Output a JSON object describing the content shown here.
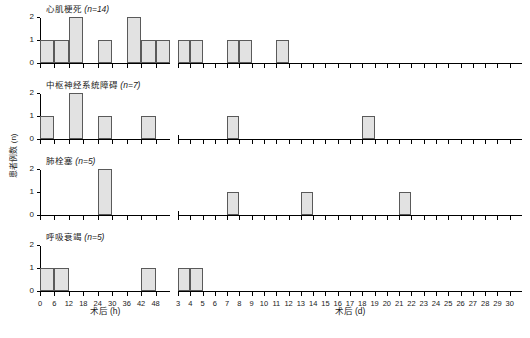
{
  "chart_data": {
    "type": "bar",
    "title": "",
    "ylabel": "患者例数 (n)",
    "ylim": [
      0,
      2
    ],
    "yticks": [
      0,
      1,
      2
    ],
    "grid": false,
    "legend": "none",
    "axes": [
      {
        "id": "hours",
        "xlabel": "术后 (h)",
        "xticks": [
          0,
          6,
          12,
          18,
          24,
          30,
          36,
          42,
          48
        ],
        "xlim": [
          0,
          54
        ],
        "bin_width": 6
      },
      {
        "id": "days",
        "xlabel": "术后 (d)",
        "xticks": [
          3,
          4,
          5,
          6,
          7,
          8,
          9,
          10,
          11,
          12,
          13,
          14,
          15,
          16,
          17,
          18,
          19,
          20,
          21,
          22,
          23,
          24,
          25,
          26,
          27,
          28,
          29,
          30
        ],
        "xlim": [
          3,
          31
        ],
        "bin_width": 1
      }
    ],
    "panels": [
      {
        "name": "心肌梗死",
        "n_label": "n=14",
        "hours": {
          "x": [
            0,
            6,
            12,
            24,
            36,
            42,
            48
          ],
          "values": [
            1,
            1,
            2,
            1,
            2,
            1,
            1
          ]
        },
        "days": {
          "x": [
            3,
            4,
            7,
            8,
            11
          ],
          "values": [
            1,
            1,
            1,
            1,
            1
          ]
        }
      },
      {
        "name": "中枢神经系统障碍",
        "n_label": "n=7",
        "hours": {
          "x": [
            0,
            12,
            24,
            42
          ],
          "values": [
            1,
            2,
            1,
            1
          ]
        },
        "days": {
          "x": [
            7,
            18
          ],
          "values": [
            1,
            1
          ]
        }
      },
      {
        "name": "肺栓塞",
        "n_label": "n=5",
        "hours": {
          "x": [
            24
          ],
          "values": [
            2
          ]
        },
        "days": {
          "x": [
            7,
            13,
            21
          ],
          "values": [
            1,
            1,
            1
          ]
        }
      },
      {
        "name": "呼吸衰竭",
        "n_label": "n=5",
        "hours": {
          "x": [
            0,
            6,
            42
          ],
          "values": [
            1,
            1,
            1
          ]
        },
        "days": {
          "x": [
            3,
            4
          ],
          "values": [
            1,
            1
          ]
        }
      }
    ]
  }
}
